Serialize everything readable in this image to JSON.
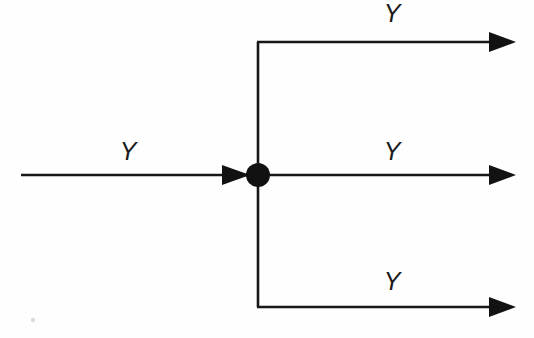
{
  "diagram": {
    "type": "block-flow",
    "background_color": "#fefefe",
    "line_color": "#171717",
    "node_color": "#111111",
    "label_color": "#1a1a1a",
    "canvas": {
      "width": 534,
      "height": 338
    },
    "junction": {
      "name": "fanout-node",
      "shape": "filled-circle",
      "cx": 258,
      "cy": 175,
      "r": 12
    },
    "input": {
      "label": "Y",
      "label_x": 128,
      "label_y": 160,
      "line_x1": 21,
      "line_x2": 248,
      "line_y": 175,
      "arrow_tip_x": 250,
      "direction": "right"
    },
    "distribution_bar": {
      "x": 258,
      "y_top": 42,
      "y_bottom": 307
    },
    "outputs": [
      {
        "id": "output-top",
        "label": "Y",
        "label_x": 392,
        "label_y": 22,
        "rail_y": 42,
        "line_x1": 258,
        "line_x2": 498,
        "arrow_tip_x": 516,
        "direction": "right"
      },
      {
        "id": "output-middle",
        "label": "Y",
        "label_x": 392,
        "label_y": 160,
        "rail_y": 175,
        "line_x1": 270,
        "line_x2": 498,
        "arrow_tip_x": 516,
        "direction": "right"
      },
      {
        "id": "output-bottom",
        "label": "Y",
        "label_x": 392,
        "label_y": 290,
        "rail_y": 307,
        "line_x1": 258,
        "line_x2": 498,
        "arrow_tip_x": 516,
        "direction": "right"
      }
    ],
    "artifact": {
      "name": "scan-speck",
      "cx": 33,
      "cy": 320,
      "r": 2.2
    }
  }
}
